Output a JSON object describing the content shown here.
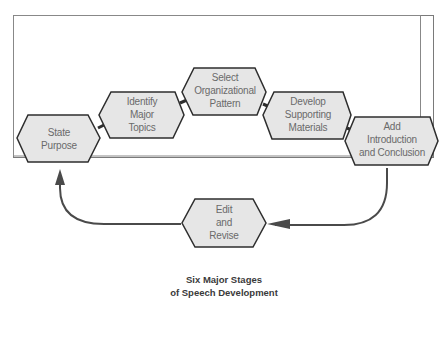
{
  "diagram": {
    "title_line1": "Six Major Stages",
    "title_line2": "of Speech Development",
    "stages": [
      {
        "id": "state-purpose",
        "lines": [
          "State",
          "Purpose"
        ]
      },
      {
        "id": "identify-major-topics",
        "lines": [
          "Identify",
          "Major",
          "Topics"
        ]
      },
      {
        "id": "select-organizational-pattern",
        "lines": [
          "Select",
          "Organizational",
          "Pattern"
        ]
      },
      {
        "id": "develop-supporting-materials",
        "lines": [
          "Develop",
          "Supporting",
          "Materials"
        ]
      },
      {
        "id": "add-introduction-and-conclusion",
        "lines": [
          "Add",
          "Introduction",
          "and Conclusion"
        ]
      },
      {
        "id": "edit-and-revise",
        "lines": [
          "Edit",
          "and",
          "Revise"
        ]
      }
    ],
    "colors": {
      "hex_fill": "#e6e6e6",
      "hex_stroke": "#2e2e2e",
      "arrow": "#4a4a4a",
      "frame": "#7a7a7a",
      "label_text": "#6a6a6a"
    }
  }
}
